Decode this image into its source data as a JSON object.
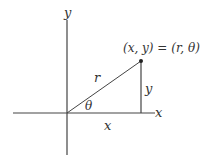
{
  "diagram": {
    "type": "polar-cartesian-coordinates",
    "labels": {
      "y_axis": "y",
      "x_axis": "x",
      "point": "(x, y) = (r, θ)",
      "radius": "r",
      "angle": "θ",
      "vertical_leg": "y",
      "horizontal_leg": "x"
    },
    "colors": {
      "line": "#444444",
      "text": "#333333",
      "background": "#ffffff"
    }
  }
}
